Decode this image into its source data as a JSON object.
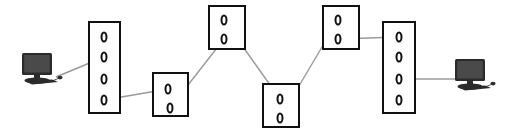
{
  "diagram": {
    "canvas": {
      "width": 518,
      "height": 132,
      "background": "#ffffff"
    },
    "style": {
      "box_stroke": "#111111",
      "box_fill": "#ffffff",
      "port_stroke": "#111111",
      "link_stroke": "#9a9a9a",
      "host_body": "#2b2b2b",
      "host_screen": "#4a4a4a"
    },
    "hosts": [
      {
        "id": "host-left",
        "label": "",
        "icon": "desktop-computer-icon",
        "x": 20,
        "y": 52,
        "width": 44,
        "height": 36
      },
      {
        "id": "host-right",
        "label": "",
        "icon": "desktop-computer-icon",
        "x": 452,
        "y": 58,
        "width": 46,
        "height": 36
      }
    ],
    "nodes": [
      {
        "id": "switch-1",
        "label": "",
        "x": 88,
        "y": 21,
        "width": 33,
        "height": 93,
        "port_count": 4,
        "ports": [
          {
            "id": "s1-p1",
            "label": "0",
            "cx": 104,
            "cy": 37
          },
          {
            "id": "s1-p2",
            "label": "0",
            "cx": 104,
            "cy": 57
          },
          {
            "id": "s1-p3",
            "label": "0",
            "cx": 104,
            "cy": 79
          },
          {
            "id": "s1-p4",
            "label": "0",
            "cx": 104,
            "cy": 100
          }
        ]
      },
      {
        "id": "switch-2",
        "label": "",
        "x": 152,
        "y": 72,
        "width": 37,
        "height": 45,
        "port_count": 2,
        "ports": [
          {
            "id": "s2-p1",
            "label": "0",
            "cx": 168,
            "cy": 89
          },
          {
            "id": "s2-p2",
            "label": "0",
            "cx": 170,
            "cy": 108
          }
        ]
      },
      {
        "id": "switch-3",
        "label": "",
        "x": 208,
        "y": 5,
        "width": 38,
        "height": 45,
        "port_count": 2,
        "ports": [
          {
            "id": "s3-p1",
            "label": "0",
            "cx": 224,
            "cy": 20
          },
          {
            "id": "s3-p2",
            "label": "0",
            "cx": 224,
            "cy": 39
          }
        ]
      },
      {
        "id": "switch-4",
        "label": "",
        "x": 262,
        "y": 83,
        "width": 38,
        "height": 45,
        "port_count": 2,
        "ports": [
          {
            "id": "s4-p1",
            "label": "0",
            "cx": 280,
            "cy": 99
          },
          {
            "id": "s4-p2",
            "label": "0",
            "cx": 280,
            "cy": 118
          }
        ]
      },
      {
        "id": "switch-5",
        "label": "",
        "x": 322,
        "y": 5,
        "width": 38,
        "height": 45,
        "port_count": 2,
        "ports": [
          {
            "id": "s5-p1",
            "label": "0",
            "cx": 338,
            "cy": 20
          },
          {
            "id": "s5-p2",
            "label": "0",
            "cx": 338,
            "cy": 39
          }
        ]
      },
      {
        "id": "switch-6",
        "label": "",
        "x": 382,
        "y": 21,
        "width": 34,
        "height": 93,
        "port_count": 4,
        "ports": [
          {
            "id": "s6-p1",
            "label": "0",
            "cx": 399,
            "cy": 37
          },
          {
            "id": "s6-p2",
            "label": "0",
            "cx": 399,
            "cy": 57
          },
          {
            "id": "s6-p3",
            "label": "0",
            "cx": 399,
            "cy": 79
          },
          {
            "id": "s6-p4",
            "label": "0",
            "cx": 399,
            "cy": 100
          }
        ]
      }
    ],
    "links": [
      {
        "id": "link-host-left-switch-1",
        "from": "host-left",
        "to": "s1-p2",
        "x1": 56,
        "y1": 77,
        "x2": 104,
        "y2": 57
      },
      {
        "id": "link-switch-1-switch-2",
        "from": "s1-p4",
        "to": "s2-p1",
        "x1": 104,
        "y1": 100,
        "x2": 168,
        "y2": 89
      },
      {
        "id": "link-switch-2-switch-3",
        "from": "s2-p2",
        "to": "s3-p2",
        "x1": 170,
        "y1": 108,
        "x2": 224,
        "y2": 39
      },
      {
        "id": "link-switch-3-switch-4",
        "from": "s3-p1",
        "to": "s4-p1",
        "x1": 224,
        "y1": 20,
        "x2": 280,
        "y2": 99
      },
      {
        "id": "link-switch-4-switch-5",
        "from": "s4-p2",
        "to": "s5-p1",
        "x1": 280,
        "y1": 118,
        "x2": 338,
        "y2": 20
      },
      {
        "id": "link-switch-5-switch-6",
        "from": "s5-p2",
        "to": "s6-p1",
        "x1": 338,
        "y1": 39,
        "x2": 399,
        "y2": 37
      },
      {
        "id": "link-switch-6-host-right",
        "from": "s6-p3",
        "to": "host-right",
        "x1": 399,
        "y1": 79,
        "x2": 466,
        "y2": 79
      }
    ]
  }
}
